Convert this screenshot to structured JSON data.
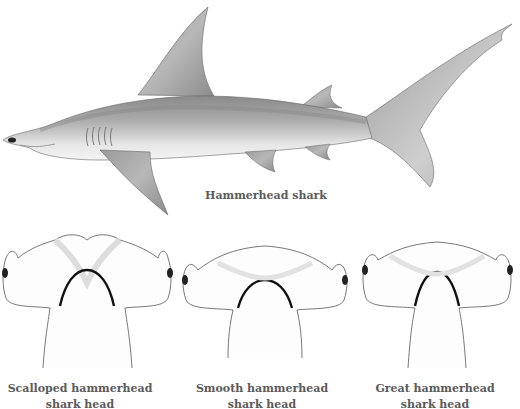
{
  "figure": {
    "main": {
      "label": "Hammerhead shark"
    },
    "heads": [
      {
        "line1": "Scalloped hammerhead",
        "line2": "shark head"
      },
      {
        "line1": "Smooth hammerhead",
        "line2": "shark head"
      },
      {
        "line1": "Great hammerhead",
        "line2": "shark head"
      }
    ]
  },
  "colors": {
    "background": "#ffffff",
    "caption": "#5a5a5a",
    "body_dark": "#7a7a7a",
    "body_light": "#e8e8e8"
  }
}
